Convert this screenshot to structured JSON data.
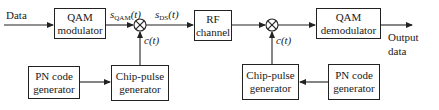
{
  "diagram": {
    "type": "block-diagram",
    "colors": {
      "line": "#222222",
      "background": "#ffffff",
      "text": "#1a1a1a"
    },
    "input_label": "Data",
    "output_label_line1": "Output",
    "output_label_line2": "data",
    "blocks": {
      "qam_mod": {
        "line1": "QAM",
        "line2": "modulator"
      },
      "rf_channel": {
        "line1": "RF",
        "line2": "channel"
      },
      "qam_demod": {
        "line1": "QAM",
        "line2": "demodulator"
      },
      "pn_tx": {
        "line1": "PN code",
        "line2": "generator"
      },
      "chip_tx": {
        "line1": "Chip-pulse",
        "line2": "generator"
      },
      "chip_rx": {
        "line1": "Chip-pulse",
        "line2": "generator"
      },
      "pn_rx": {
        "line1": "PN code",
        "line2": "generator"
      }
    },
    "signals": {
      "s_qam": {
        "base": "s",
        "sub": "QAM",
        "arg": "(t)"
      },
      "s_ds": {
        "base": "s",
        "sub": "DS",
        "arg": "(t)"
      },
      "c_tx": "c(t)",
      "c_rx": "c(t)"
    },
    "multipliers": [
      {
        "id": "mixer-tx",
        "symbol": "⊗"
      },
      {
        "id": "mixer-rx",
        "symbol": "⊗"
      }
    ]
  }
}
